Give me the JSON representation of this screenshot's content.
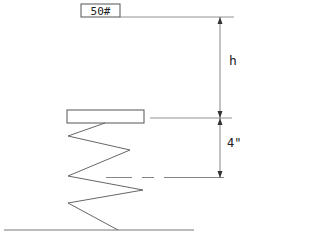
{
  "diagram": {
    "weight_label": "50#",
    "height_label": "h",
    "compression_label": "4\"",
    "colors": {
      "line": "#555555",
      "text": "#222222",
      "background": "#ffffff"
    }
  }
}
